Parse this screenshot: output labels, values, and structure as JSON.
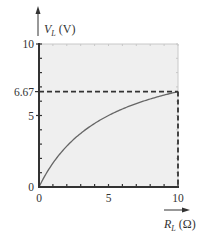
{
  "chart_data": {
    "type": "line",
    "title": "",
    "xlabel": "R_L (Ω)",
    "ylabel": "V_L (V)",
    "xlabel_main": "R",
    "xlabel_sub": "L",
    "xlabel_unit": " (Ω)",
    "ylabel_main": "V",
    "ylabel_sub": "L",
    "ylabel_unit": " (V)",
    "xlim": [
      0,
      10
    ],
    "ylim": [
      0,
      10
    ],
    "x_ticks": [
      0,
      5,
      10
    ],
    "x_tick_labels": [
      "0",
      "5",
      "10"
    ],
    "y_ticks": [
      0,
      5,
      6.67,
      10
    ],
    "y_tick_labels": [
      "0",
      "5",
      "6.67",
      "10"
    ],
    "minor_tick_step": 1,
    "grid": false,
    "legend": null,
    "series": [
      {
        "name": "V_L vs R_L",
        "formula": "V_L = 10 * R_L / (R_L + 5)",
        "x": [
          0,
          1,
          2,
          3,
          4,
          5,
          6,
          7,
          8,
          9,
          10
        ],
        "values": [
          0,
          1.67,
          2.86,
          3.75,
          4.44,
          5.0,
          5.45,
          5.83,
          6.15,
          6.43,
          6.67
        ]
      }
    ],
    "annotations": [
      {
        "type": "hline",
        "y": 6.67,
        "x_range": [
          0,
          10
        ],
        "style": "dashed"
      },
      {
        "type": "vline",
        "x": 10,
        "y_range": [
          0,
          6.67
        ],
        "style": "dashed"
      }
    ]
  },
  "colors": {
    "plot_background": "#efefef",
    "axis": "#333333",
    "frame": "#c8c8c8",
    "curve": "#666666",
    "dashed": "#333333"
  }
}
